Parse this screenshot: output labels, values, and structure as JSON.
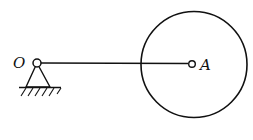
{
  "diagram": {
    "labels": {
      "pivot": "O",
      "point": "A"
    },
    "elements": {
      "rod": "bar OA",
      "disk": "circle centered at A",
      "support": "fixed pin support at O"
    },
    "colors": {
      "stroke": "#111111",
      "background": "#ffffff"
    }
  }
}
